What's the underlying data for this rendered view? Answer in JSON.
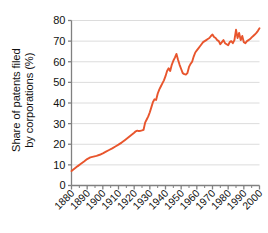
{
  "chart_data": {
    "type": "line",
    "title": "",
    "subtitle": "",
    "xlabel": "",
    "ylabel_line1": "Share of patents filed",
    "ylabel_line2": "by corporations (%)",
    "ylabel": "Share of patents filed by corporations (%)",
    "xlim": [
      1880,
      2000
    ],
    "ylim": [
      0,
      80
    ],
    "yticks": [
      0,
      10,
      20,
      30,
      40,
      50,
      60,
      70,
      80
    ],
    "ytick_labels": [
      "0",
      "10",
      "20",
      "30",
      "40",
      "50",
      "60",
      "70",
      "80"
    ],
    "xticks": [
      1880,
      1890,
      1900,
      1910,
      1920,
      1930,
      1940,
      1950,
      1960,
      1970,
      1980,
      1990,
      2000
    ],
    "xtick_labels": [
      "1880",
      "1890",
      "1900",
      "1910",
      "1920",
      "1930",
      "1940",
      "1950",
      "1960",
      "1970",
      "1980",
      "1990",
      "2000"
    ],
    "grid": true,
    "grid_axis": "y",
    "legend": false,
    "legend_position": "none",
    "line_color": "#E8552D",
    "grid_color": "#DCDCDC",
    "axis_color": "#808080",
    "background": "#FFFFFF",
    "series": [
      {
        "name": "Share of patents filed by corporations",
        "color": "#E8552D",
        "x": [
          1880,
          1882,
          1884,
          1886,
          1888,
          1890,
          1892,
          1894,
          1896,
          1898,
          1900,
          1902,
          1904,
          1906,
          1908,
          1910,
          1912,
          1914,
          1916,
          1918,
          1920,
          1921,
          1922,
          1923,
          1924,
          1925,
          1926,
          1927,
          1928,
          1929,
          1930,
          1931,
          1932,
          1933,
          1934,
          1935,
          1936,
          1937,
          1938,
          1939,
          1940,
          1941,
          1942,
          1943,
          1944,
          1945,
          1946,
          1947,
          1948,
          1949,
          1950,
          1951,
          1952,
          1953,
          1954,
          1955,
          1956,
          1957,
          1958,
          1959,
          1960,
          1961,
          1962,
          1963,
          1964,
          1965,
          1966,
          1967,
          1968,
          1969,
          1970,
          1971,
          1972,
          1973,
          1974,
          1975,
          1976,
          1977,
          1978,
          1979,
          1980,
          1981,
          1982,
          1983,
          1984,
          1985,
          1986,
          1987,
          1988,
          1989,
          1990,
          1991,
          1992,
          1993,
          1994,
          1995,
          1996,
          1997,
          1998,
          1999,
          2000
        ],
        "values": [
          7.0,
          8.2,
          9.4,
          10.5,
          11.6,
          12.8,
          13.6,
          14.0,
          14.4,
          14.9,
          15.6,
          16.4,
          17.2,
          18.0,
          18.9,
          19.8,
          20.8,
          22.0,
          23.2,
          24.4,
          25.6,
          26.3,
          26.6,
          26.4,
          26.5,
          26.7,
          27.0,
          30.5,
          32.0,
          33.5,
          35.5,
          38.0,
          40.5,
          41.8,
          41.5,
          44.5,
          46.5,
          48.0,
          49.5,
          51.0,
          53.0,
          55.5,
          56.8,
          55.5,
          58.5,
          60.5,
          62.0,
          63.8,
          61.0,
          58.5,
          56.5,
          54.5,
          54.0,
          53.8,
          54.5,
          57.5,
          59.0,
          60.0,
          62.5,
          64.5,
          65.5,
          66.5,
          67.5,
          68.5,
          69.5,
          70.0,
          70.5,
          71.0,
          71.5,
          72.5,
          73.2,
          72.0,
          71.5,
          70.5,
          70.0,
          68.5,
          69.5,
          70.5,
          69.0,
          68.5,
          68.0,
          69.5,
          70.0,
          69.0,
          70.5,
          75.5,
          71.5,
          74.0,
          70.5,
          72.5,
          69.5,
          69.0,
          70.0,
          70.5,
          71.0,
          71.8,
          72.5,
          73.2,
          74.0,
          75.0,
          76.2
        ]
      }
    ]
  }
}
